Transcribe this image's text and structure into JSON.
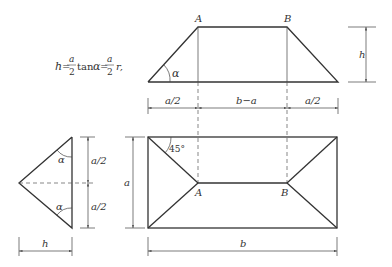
{
  "formula": {
    "h": "h",
    "eq1": "=",
    "frac1_num": "a",
    "frac1_den": "2",
    "tan": "tan",
    "alpha": "α",
    "eq2": "=",
    "frac2_num": "a",
    "frac2_den": "2",
    "r": "r,"
  },
  "elevation": {
    "point_a": "A",
    "point_b": "B",
    "angle_label": "α",
    "height_label": "h",
    "dim_left": "a/2",
    "dim_middle": "b−a",
    "dim_right": "a/2"
  },
  "plan": {
    "point_a": "A",
    "point_b": "B",
    "angle_label": "45°",
    "width_label": "a",
    "length_label": "b"
  },
  "side_view": {
    "angle_top": "α",
    "angle_bottom": "α",
    "dim_top": "a/2",
    "dim_bottom": "a/2",
    "height_label": "h"
  }
}
